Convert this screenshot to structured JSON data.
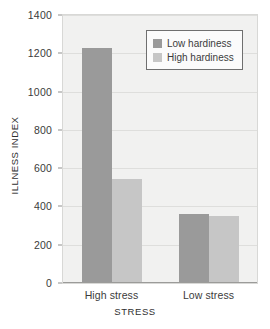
{
  "chart_data": {
    "type": "bar",
    "title": "",
    "subtitle": "",
    "xlabel": "STRESS",
    "ylabel": "ILLNESS INDEX",
    "categories": [
      "High stress",
      "Low stress"
    ],
    "series": [
      {
        "name": "Low hardiness",
        "values": [
          1220,
          355
        ],
        "color": "#9a9a9a"
      },
      {
        "name": "High hardiness",
        "values": [
          540,
          345
        ],
        "color": "#c6c6c6"
      }
    ],
    "ylim": [
      0,
      1400
    ],
    "yticks": [
      0,
      200,
      400,
      600,
      800,
      1000,
      1200,
      1400
    ],
    "ytick_labels": [
      "0",
      "200",
      "400",
      "600",
      "800",
      "1000",
      "1200",
      "1400"
    ],
    "grid": "horizontal",
    "legend_position": "top-right",
    "plot_background": "#f1f1f0"
  },
  "legend": {
    "entries": [
      {
        "label": "Low hardiness",
        "color": "#9a9a9a"
      },
      {
        "label": "High hardiness",
        "color": "#c6c6c6"
      }
    ]
  },
  "axes": {
    "y_title": "ILLNESS INDEX",
    "x_title": "STRESS"
  }
}
